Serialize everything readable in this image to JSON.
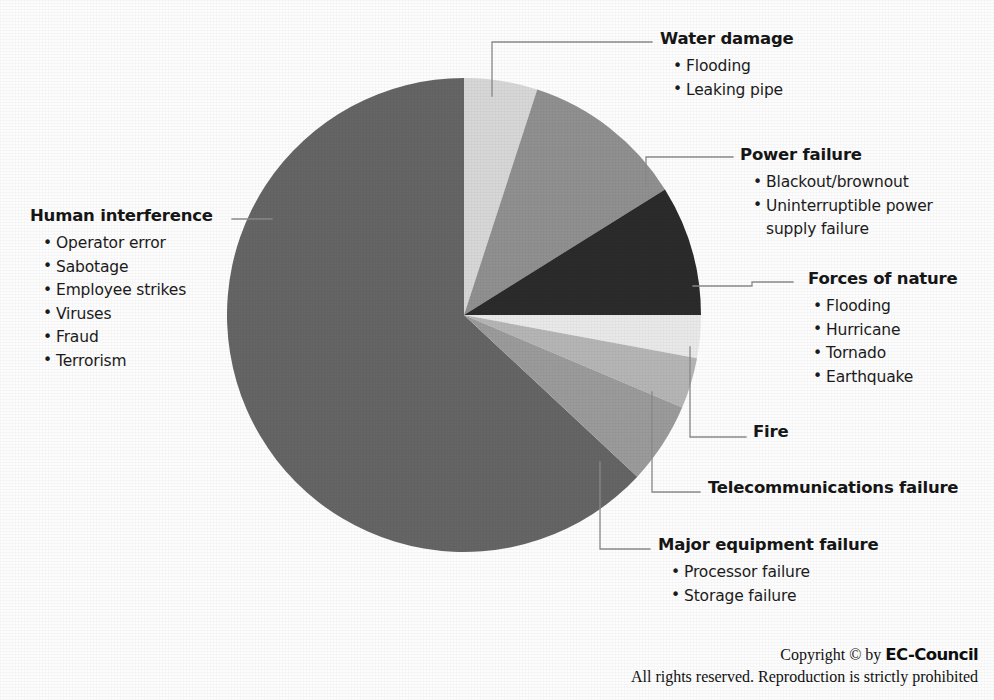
{
  "chart_data": {
    "type": "pie",
    "title": "",
    "legend_position": "callouts",
    "center": {
      "x": 464,
      "y": 315
    },
    "radius": 237,
    "start_angle_deg": 0,
    "direction": "clockwise",
    "categories": [
      "Water damage",
      "Power failure",
      "Forces of nature",
      "Fire",
      "Telecommunications failure",
      "Major equipment failure",
      "Human interference"
    ],
    "values": [
      5,
      11,
      9,
      3,
      3.5,
      5.5,
      63
    ],
    "units": "percent",
    "colors": [
      "#d7d7d7",
      "#909090",
      "#2b2b2b",
      "#e9e9e9",
      "#b5b5b5",
      "#9b9b9b",
      "#656565"
    ],
    "slices": [
      {
        "label": "Water damage",
        "value": 5,
        "color": "#d7d7d7",
        "start_deg": 0,
        "end_deg": 18
      },
      {
        "label": "Power failure",
        "value": 11,
        "color": "#909090",
        "start_deg": 18,
        "end_deg": 58
      },
      {
        "label": "Forces of nature",
        "value": 9,
        "color": "#2b2b2b",
        "start_deg": 58,
        "end_deg": 90
      },
      {
        "label": "Fire",
        "value": 3,
        "color": "#e9e9e9",
        "start_deg": 90,
        "end_deg": 100.5
      },
      {
        "label": "Telecommunications failure",
        "value": 3.5,
        "color": "#b5b5b5",
        "start_deg": 100.5,
        "end_deg": 113
      },
      {
        "label": "Major equipment failure",
        "value": 5.5,
        "color": "#9b9b9b",
        "start_deg": 113,
        "end_deg": 133
      },
      {
        "label": "Human interference",
        "value": 63,
        "color": "#656565",
        "start_deg": 133,
        "end_deg": 360
      }
    ]
  },
  "callouts": {
    "water_damage": {
      "title": "Water damage",
      "items": [
        "Flooding",
        "Leaking pipe"
      ]
    },
    "power_failure": {
      "title": "Power failure",
      "items": [
        "Blackout/brownout",
        "Uninterruptible power",
        "supply failure"
      ]
    },
    "forces_of_nature": {
      "title": "Forces of nature",
      "items": [
        "Flooding",
        "Hurricane",
        "Tornado",
        "Earthquake"
      ]
    },
    "fire": {
      "title": "Fire",
      "items": []
    },
    "telecommunications_failure": {
      "title": "Telecommunications failure",
      "items": []
    },
    "major_equipment_failure": {
      "title": "Major equipment failure",
      "items": [
        "Processor failure",
        "Storage failure"
      ]
    },
    "human_interference": {
      "title": "Human interference",
      "items": [
        "Operator error",
        "Sabotage",
        "Employee strikes",
        "Viruses",
        "Fraud",
        "Terrorism"
      ]
    }
  },
  "bullet_glyph": "•",
  "footer": {
    "copyright_prefix": "Copyright © by ",
    "brand": "EC-Council",
    "rights": "All rights reserved. Reproduction is strictly prohibited"
  }
}
